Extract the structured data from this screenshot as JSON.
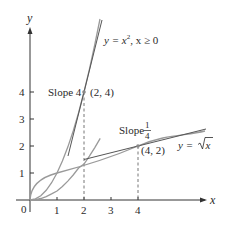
{
  "diagram": {
    "type": "function-graph",
    "axes": {
      "x_label": "x",
      "y_label": "y",
      "origin_label": "0",
      "x_ticks": [
        "1",
        "2",
        "3",
        "4"
      ],
      "y_ticks": [
        "1",
        "2",
        "3",
        "4"
      ]
    },
    "curves": [
      {
        "name": "parabola",
        "label_y": "y = x",
        "label_exp": "2",
        "label_rest": ", x ≥ 0",
        "expression": "y = x^2, x >= 0"
      },
      {
        "name": "square-root",
        "label_y": "y = ",
        "label_radicand": "x",
        "expression": "y = sqrt(x)"
      }
    ],
    "points": [
      {
        "label": "(2, 4)",
        "x": 2,
        "y": 4,
        "slope_label": "Slope 4"
      },
      {
        "label": "(4, 2)",
        "x": 4,
        "y": 2,
        "slope_label_prefix": "Slope",
        "slope_num": "1",
        "slope_den": "4"
      }
    ],
    "colors": {
      "axis": "#333333",
      "curve": "#9a9a9a",
      "tangent": "#555555",
      "dashed": "#666666",
      "text": "#2a2a2a"
    }
  }
}
